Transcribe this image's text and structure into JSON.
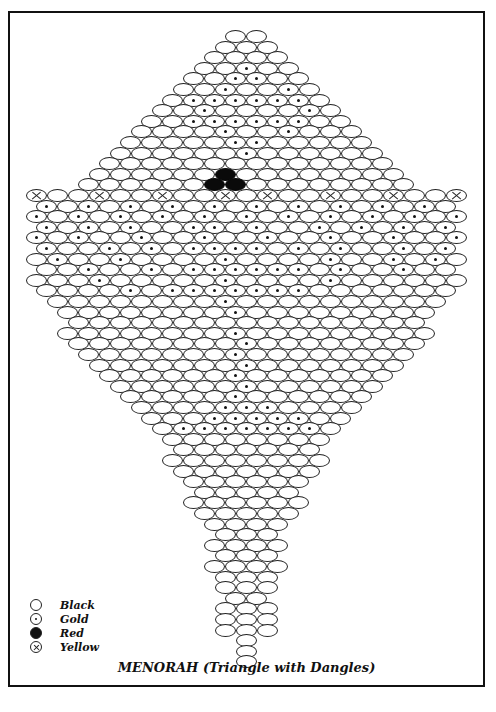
{
  "title": "MENORAH (Triangle with Dangles)",
  "legend": [
    {
      "symbol": "open-circle",
      "type": "black",
      "label": "Black"
    },
    {
      "symbol": "dot-circle",
      "type": "gold",
      "label": "Gold"
    },
    {
      "symbol": "filled-circle",
      "type": "red",
      "label": "Red"
    },
    {
      "symbol": "x-circle",
      "type": "yellow",
      "label": "Yellow"
    }
  ],
  "pattern": {
    "center_x": 246,
    "top_y": 30,
    "bead_w": 21,
    "row_h": 10.6,
    "key": {
      "B": "black",
      "G": "gold",
      "R": "red",
      "Y": "yellow"
    },
    "rows": [
      "BB",
      "BBB",
      "BBBB",
      "BBGBB",
      "BBGGBB",
      "BBGBBGB",
      "BGGGGGGB",
      "BBGBBBBGB",
      "BBGGGGGGBB",
      "BBBBGBBGBBB",
      "BBBBBGGBBBBB",
      "BBBBBBGBBBBBB",
      "BBBBBBBBBBBBBB",
      "BBBBBBRBBBBBBBB",
      "BBBBBBRRBBBBBBBB",
      "YBBYBBYBBYBYBBYBBYBBY",
      "GBGBGBGBGBGBGBGBGBGB",
      "GBGBGBGBGBGBGBGBGBGBG",
      "GBGBGBBGGBGBBGBGBGBG",
      "GBGBBGBBGBBGBBGBBGBBG",
      "GBBGBGBGGGGBGBGBBGBG",
      "BGBBGBBBBGBBBBGBBGBGB",
      "BBGBBGBGGGGGGBGBBGBB",
      "BBBGBBBBBGBBBBGBBBBBB",
      "BBBBGBGGGGGGGBBBBBBB",
      "BBBBBBBBGBBBBBBBBBB",
      "BBBBBBBBGBBBBBBBBB",
      "BBBBBBBBBBBBBBBBB",
      "BBBBBBBBGBBBBBBBBB",
      "BBBBBBBBGBBBBBBBB",
      "BBBBBBBGBBBBBBBB",
      "BBBBBBBGBBBBBBB",
      "BBBBBBGBBBBBBB",
      "BBBBBBGBBBBBB",
      "BBBBBGBBBBBB",
      "BBBBGGGBBBB",
      "BBBGGGGGBB",
      "BGGGGGGGB",
      "BBBBBBBB",
      "BBBBBBB",
      "BBBBBBBB",
      "BBBBBBB",
      "BBBBBB",
      "BBBBB",
      "BBBBBB",
      "BBBBB",
      "BBBB",
      "BBB",
      "BBBB",
      "BBB",
      "BBBB",
      "BBB",
      "BBB",
      "BB",
      "BBB",
      "BBB",
      "BBB",
      "B",
      "B",
      "B"
    ]
  }
}
